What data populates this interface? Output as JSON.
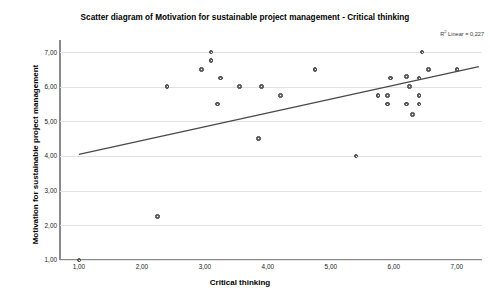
{
  "chart_data": {
    "type": "scatter",
    "title": "Scatter diagram of Motivation for sustainable project management - Critical thinking",
    "xlabel": "Critical thinking",
    "ylabel": "Motivation for sustainable project management",
    "xlim": [
      0.7,
      7.4
    ],
    "ylim": [
      1.0,
      7.35
    ],
    "xticks": [
      1,
      2,
      3,
      4,
      5,
      6,
      7
    ],
    "yticks": [
      1,
      2,
      3,
      4,
      5,
      6,
      7
    ],
    "xtick_labels": [
      "1,00",
      "2,00",
      "3,00",
      "4,00",
      "5,00",
      "6,00",
      "7,00"
    ],
    "ytick_labels": [
      "1,00",
      "2,00",
      "3,00",
      "4,00",
      "5,00",
      "6,00",
      "7,00"
    ],
    "grid": true,
    "grid_axis": "y",
    "annotation": "R² Linear = 0,227",
    "annotation_prefix": "R",
    "annotation_sup": "2",
    "annotation_suffix": " Linear = 0,227",
    "r_squared": 0.227,
    "fit_line": {
      "type": "linear",
      "x_start": 1.0,
      "y_start": 4.05,
      "x_end": 7.35,
      "y_end": 6.58
    },
    "marker": {
      "shape": "circle",
      "fill": "#6b6b6b",
      "edge": "#4a4a4a",
      "size": 4.6
    },
    "points": [
      {
        "x": 1.0,
        "y": 1.0
      },
      {
        "x": 2.25,
        "y": 2.25
      },
      {
        "x": 2.4,
        "y": 6.0
      },
      {
        "x": 3.1,
        "y": 7.0
      },
      {
        "x": 3.1,
        "y": 6.75
      },
      {
        "x": 2.95,
        "y": 6.5
      },
      {
        "x": 3.25,
        "y": 6.25
      },
      {
        "x": 3.2,
        "y": 5.5
      },
      {
        "x": 3.55,
        "y": 6.0
      },
      {
        "x": 3.9,
        "y": 6.0
      },
      {
        "x": 3.85,
        "y": 4.5
      },
      {
        "x": 4.2,
        "y": 5.75
      },
      {
        "x": 4.75,
        "y": 6.5
      },
      {
        "x": 5.4,
        "y": 4.0
      },
      {
        "x": 5.75,
        "y": 5.75
      },
      {
        "x": 5.95,
        "y": 6.25
      },
      {
        "x": 5.9,
        "y": 5.75
      },
      {
        "x": 5.9,
        "y": 5.5
      },
      {
        "x": 6.2,
        "y": 5.5
      },
      {
        "x": 6.2,
        "y": 6.3
      },
      {
        "x": 6.25,
        "y": 6.0
      },
      {
        "x": 6.4,
        "y": 5.5
      },
      {
        "x": 6.4,
        "y": 5.75
      },
      {
        "x": 6.4,
        "y": 6.25
      },
      {
        "x": 6.3,
        "y": 5.2
      },
      {
        "x": 6.45,
        "y": 7.0
      },
      {
        "x": 6.55,
        "y": 6.5
      },
      {
        "x": 7.0,
        "y": 6.5
      }
    ]
  }
}
